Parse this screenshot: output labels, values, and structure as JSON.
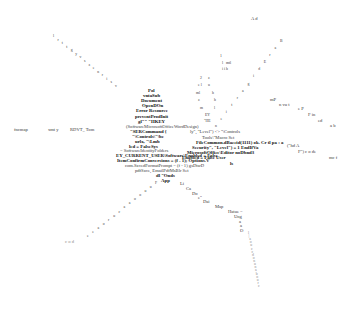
{
  "center_stack": [
    {
      "text": "Pol",
      "x": 148,
      "y": 89,
      "bold": true
    },
    {
      "text": "vntaSub",
      "x": 143,
      "y": 94,
      "bold": true
    },
    {
      "text": "Document",
      "x": 141,
      "y": 99,
      "bold": true
    },
    {
      "text": "OpenDOn",
      "x": 142,
      "y": 104,
      "bold": true
    },
    {
      "text": "Error Resource",
      "x": 136,
      "y": 109,
      "bold": true
    },
    {
      "text": "preventProdInit",
      "x": 135,
      "y": 115,
      "bold": true
    },
    {
      "text": "gl\"\" \"HKEY",
      "x": 138,
      "y": 120,
      "bold": true
    },
    {
      "text": "(SoftwareMicrosoftOfficeWordDesign)",
      "x": 126,
      "y": 125,
      "bold": false
    },
    {
      "text": "\"SERCommand {",
      "x": 130,
      "y": 130,
      "bold": true
    },
    {
      "text": "\"\\Controls\\\"\\be",
      "x": 132,
      "y": 135,
      "bold": true
    },
    {
      "text": "urlx, \"\\Lmb",
      "x": 135,
      "y": 140,
      "bold": true
    },
    {
      "text": "led = FalseSys",
      "x": 129,
      "y": 145,
      "bold": true
    },
    {
      "text": "= SoftwareIdentityFolders",
      "x": 120,
      "y": 149,
      "bold": false
    },
    {
      "text": "EY_CURRENT_USER\\Software\\Enabled = False",
      "x": 116,
      "y": 154,
      "bold": true
    },
    {
      "text": "ItemConfirmConversions = (f - 1); Options.V",
      "x": 117,
      "y": 159,
      "bold": true
    },
    {
      "text": "com.SavedFormatPrompt = (f - 1) gsDtsrD",
      "x": 125,
      "y": 164,
      "bold": false
    },
    {
      "text": "pdfSave, EmailPdfMsBlr Set",
      "x": 135,
      "y": 169,
      "bold": false
    },
    {
      "text": "dl \"Onds",
      "x": 156,
      "y": 174,
      "bold": true
    },
    {
      "text": "App",
      "x": 161,
      "y": 179,
      "bold": true
    }
  ],
  "right_cluster": [
    {
      "text": "ly\", \"Level\") <> \"\\Controls",
      "x": 190,
      "y": 130,
      "bold": false
    },
    {
      "text": "Tools\\\"Macro Set",
      "x": 202,
      "y": 136,
      "bold": false
    },
    {
      "text": "FileCommon.dBaccid(1111) ok. Cr tl  pa  : a",
      "x": 196,
      "y": 141,
      "bold": true
    },
    {
      "text": "Security\", \"Level\") = 1   EndIfVa",
      "x": 192,
      "y": 146,
      "bold": true
    },
    {
      "text": "MicrosoftOffice\\Editor   noDbnd3",
      "x": 187,
      "y": 151,
      "bold": true
    },
    {
      "text": "Enabled = False      User",
      "x": 182,
      "y": 156,
      "bold": true
    },
    {
      "text": "ls",
      "x": 230,
      "y": 162,
      "bold": true
    },
    {
      "text": "(\"hd  A",
      "x": 287,
      "y": 144,
      "bold": false
    },
    {
      "text": "F\") c o de",
      "x": 298,
      "y": 150,
      "bold": false
    },
    {
      "text": "mc f",
      "x": 329,
      "y": 156,
      "bold": false
    }
  ],
  "left_row": [
    {
      "text": "fncmap",
      "x": 14,
      "y": 128
    },
    {
      "text": "xmt y",
      "x": 48,
      "y": 128
    },
    {
      "text": "RDVT_ Tom",
      "x": 70,
      "y": 128
    }
  ],
  "upper_left_arm": [
    "l",
    "r",
    "t",
    "t",
    "g",
    "y",
    "v",
    "s",
    "z",
    "e",
    "n",
    "r",
    "i",
    "s",
    "v"
  ],
  "upper_right_arm": [
    "B",
    "a",
    "r",
    "E",
    "d",
    "i",
    "g",
    "a",
    "r",
    "t",
    "i",
    "e",
    "n"
  ],
  "right_arm": [
    {
      "text": "mP",
      "x": 270,
      "y": 98
    },
    {
      "text": "n vu t",
      "x": 279,
      "y": 103
    },
    {
      "text": "e P",
      "x": 298,
      "y": 107
    },
    {
      "text": "F in",
      "x": 308,
      "y": 113
    },
    {
      "text": "ed",
      "x": 318,
      "y": 119
    },
    {
      "text": "a b",
      "x": 330,
      "y": 124
    }
  ],
  "top_label": {
    "text": "A d",
    "x": 251,
    "y": 17
  },
  "lower_right_arm": [
    {
      "text": "Li",
      "x": 180,
      "y": 182
    },
    {
      "text": "Ca",
      "x": 186,
      "y": 187
    },
    {
      "text": "Do",
      "x": 192,
      "y": 192
    },
    {
      "text": "e\"",
      "x": 198,
      "y": 196
    },
    {
      "text": "Dai",
      "x": 203,
      "y": 200
    },
    {
      "text": "Map",
      "x": 215,
      "y": 205
    },
    {
      "text": "Hatue =",
      "x": 228,
      "y": 210
    },
    {
      "text": "Ung",
      "x": 234,
      "y": 215
    },
    {
      "text": "a",
      "x": 239,
      "y": 220
    },
    {
      "text": "a",
      "x": 240,
      "y": 224
    },
    {
      "text": "O",
      "x": 240,
      "y": 229
    }
  ],
  "lower_left_arm": [
    "F",
    "u",
    "u",
    "o",
    "o",
    "a",
    "a",
    "c",
    "u",
    "r",
    "o",
    "a",
    "e",
    "e"
  ],
  "lower_left_label": {
    "text": "c o d",
    "x": 65,
    "y": 240
  },
  "vertical_tail": [
    "l",
    "|",
    "a",
    "o",
    "u",
    "c",
    "c",
    "d",
    "o",
    "n",
    "u",
    "n",
    "a",
    "b",
    "o",
    "u",
    "r",
    "c"
  ]
}
